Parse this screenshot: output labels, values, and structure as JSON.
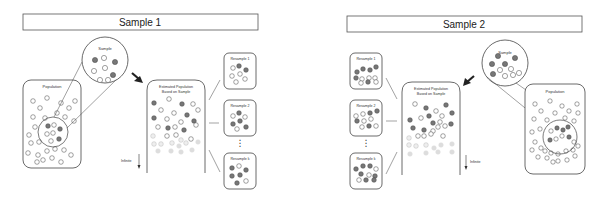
{
  "panels": [
    {
      "title": "Sample 1",
      "population_label": "Population",
      "sample_label": "Sample",
      "estimated_label_line1": "Estimated Population",
      "estimated_label_line2": "Based on Sample",
      "infinite_label": "Infinite",
      "resamples": [
        "Resample 1",
        "Resample 2",
        "Resample k"
      ],
      "ellipsis": "⋮"
    },
    {
      "title": "Sample 2",
      "population_label": "Population",
      "sample_label": "Sample",
      "estimated_label_line1": "Estimated Population",
      "estimated_label_line2": "Based on Sample",
      "infinite_label": "Infinite",
      "resamples": [
        "Resample 1",
        "Resample 2",
        "Resample k"
      ],
      "ellipsis": "⋮"
    }
  ],
  "colors": {
    "stroke": "#444444",
    "filled_dot": "#777777",
    "light_dot": "#bbbbbb",
    "background": "#ffffff"
  }
}
